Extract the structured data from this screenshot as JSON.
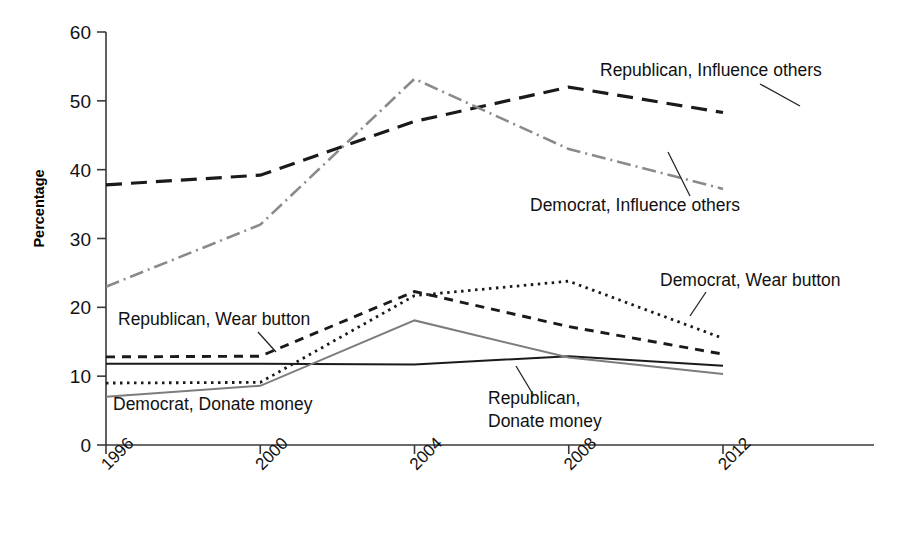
{
  "chart_data": {
    "type": "line",
    "title": "",
    "xlabel": "",
    "ylabel": "Percentage",
    "x": [
      1996,
      2000,
      2004,
      2008,
      2012
    ],
    "categories": [
      "1996",
      "2000",
      "2004",
      "2008",
      "2012"
    ],
    "ylim": [
      0,
      60
    ],
    "yticks": [
      0,
      10,
      20,
      30,
      40,
      50,
      60
    ],
    "grid": false,
    "legend_position": "inline-annotations",
    "series": [
      {
        "name": "Republican, Influence others",
        "values": [
          37.8,
          39.2,
          47.0,
          52.0,
          48.3
        ],
        "style": "long-dash",
        "color": "#1a1a1a",
        "width": 3.2,
        "dasharray": "16 9"
      },
      {
        "name": "Democrat, Influence others",
        "values": [
          23.0,
          32.0,
          53.2,
          43.0,
          37.2
        ],
        "style": "dash-dot",
        "color": "#8a8a8a",
        "width": 2.6,
        "dasharray": "14 5 2 5"
      },
      {
        "name": "Democrat, Wear button",
        "values": [
          9.0,
          9.1,
          21.7,
          23.8,
          15.5
        ],
        "style": "dotted",
        "color": "#1a1a1a",
        "width": 2.8,
        "dasharray": "2.5 4.5"
      },
      {
        "name": "Republican, Wear button",
        "values": [
          12.8,
          12.9,
          22.3,
          17.2,
          13.2
        ],
        "style": "dashed",
        "color": "#1a1a1a",
        "width": 2.9,
        "dasharray": "9 7"
      },
      {
        "name": "Republican, Donate money",
        "values": [
          11.8,
          11.8,
          11.7,
          12.9,
          11.5
        ],
        "style": "solid",
        "color": "#1a1a1a",
        "width": 2.0,
        "dasharray": "none"
      },
      {
        "name": "Democrat, Donate money",
        "values": [
          7.0,
          8.6,
          18.1,
          12.7,
          10.3
        ],
        "style": "solid-gray",
        "color": "#7d7d7d",
        "width": 2.0,
        "dasharray": "none"
      }
    ],
    "annotations": [
      {
        "id": "rep-influence",
        "text": "Republican, Influence others",
        "x": 600,
        "y": 76
      },
      {
        "id": "dem-influence",
        "text": "Democrat, Influence others",
        "x": 530,
        "y": 211
      },
      {
        "id": "dem-wear",
        "text": "Democrat, Wear button",
        "x": 660,
        "y": 286
      },
      {
        "id": "rep-wear",
        "text": "Republican, Wear button",
        "x": 118,
        "y": 325
      },
      {
        "id": "rep-donate-1",
        "text": "Republican,",
        "x": 488,
        "y": 404
      },
      {
        "id": "rep-donate-2",
        "text": "Donate money",
        "x": 488,
        "y": 427
      },
      {
        "id": "dem-donate",
        "text": "Democrat, Donate money",
        "x": 113,
        "y": 410
      }
    ]
  }
}
